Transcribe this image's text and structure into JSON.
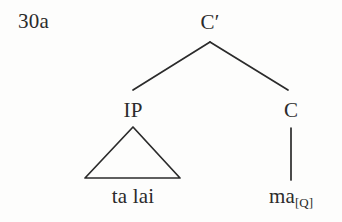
{
  "figure": {
    "example_number": "30a",
    "type": "syntactic-tree-diagram",
    "background_color": "#fdfdfc",
    "ink_color": "#2b2b2b"
  },
  "tree": {
    "root": {
      "id": "cbar",
      "label": "C′",
      "x": 210,
      "y": 12
    },
    "nodes": [
      {
        "id": "ip",
        "label": "IP",
        "x": 133,
        "y": 100,
        "parent": "cbar",
        "expansion": "triangle"
      },
      {
        "id": "c",
        "label": "C",
        "x": 291,
        "y": 100,
        "parent": "cbar",
        "expansion": "line"
      }
    ],
    "terminals": [
      {
        "id": "talai",
        "text": "ta lai",
        "subscript": "",
        "x": 133,
        "y": 186,
        "parent": "ip"
      },
      {
        "id": "ma",
        "text": "ma",
        "subscript": "[Q]",
        "x": 291,
        "y": 186,
        "parent": "c"
      }
    ],
    "branches": [
      {
        "id": "cbar-to-ip",
        "from": [
          210,
          42
        ],
        "to": [
          133,
          90
        ]
      },
      {
        "id": "cbar-to-c",
        "from": [
          210,
          42
        ],
        "to": [
          288,
          90
        ]
      },
      {
        "id": "c-to-ma",
        "from": [
          291,
          128
        ],
        "to": [
          291,
          180
        ]
      }
    ],
    "triangle": {
      "id": "ip-triangle",
      "apex": [
        133,
        127
      ],
      "base_left": [
        85,
        178
      ],
      "base_right": [
        180,
        178
      ]
    },
    "stroke_width": 1.6
  }
}
